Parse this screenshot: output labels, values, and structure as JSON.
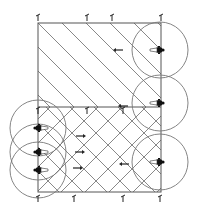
{
  "diagram": {
    "title": "",
    "colors": {
      "line": "#555555",
      "hatch": "#6a6a6a",
      "figure": "#111111",
      "background": "#ffffff"
    },
    "frame": {
      "x": 38,
      "y": 23,
      "w": 123,
      "h": 169,
      "divider_y": 107
    },
    "top_markers": [
      38,
      87,
      112,
      161
    ],
    "bottom_markers": [
      38,
      74,
      123,
      160
    ],
    "divider_markers": [
      38,
      87,
      123
    ],
    "right_sources": [
      {
        "cx": 160,
        "cy": 50,
        "r": 28
      },
      {
        "cx": 160,
        "cy": 103,
        "r": 28
      },
      {
        "cx": 160,
        "cy": 162,
        "r": 28
      }
    ],
    "left_sources": [
      {
        "cx": 38,
        "cy": 128,
        "r": 28
      },
      {
        "cx": 38,
        "cy": 152,
        "r": 28
      },
      {
        "cx": 38,
        "cy": 170,
        "r": 28
      }
    ],
    "arrows": [
      {
        "x": 118,
        "y": 50,
        "dir": "left"
      },
      {
        "x": 123,
        "y": 106,
        "dir": "left"
      },
      {
        "x": 81,
        "y": 136,
        "dir": "right"
      },
      {
        "x": 80,
        "y": 152,
        "dir": "right"
      },
      {
        "x": 78,
        "y": 168,
        "dir": "right"
      },
      {
        "x": 124,
        "y": 164,
        "dir": "left"
      }
    ]
  }
}
